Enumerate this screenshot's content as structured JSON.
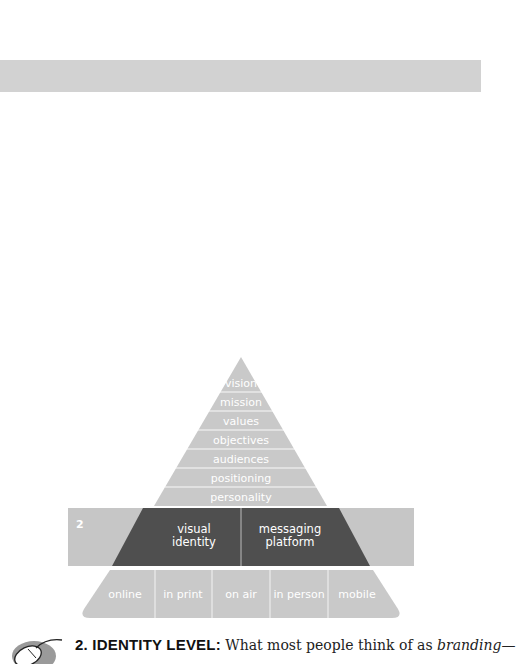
{
  "header_band": {
    "color": "#d2d2d2"
  },
  "pyramid": {
    "colors": {
      "light": "#c9c9c9",
      "band": "#c6c6c6",
      "dark": "#4f4f4f",
      "divider": "#ffffff",
      "label": "#ffffff"
    },
    "top_level": {
      "rows": [
        "vision",
        "mission",
        "values",
        "objectives",
        "audiences",
        "positioning",
        "personality"
      ]
    },
    "identity_level": {
      "number": "2",
      "cells": [
        {
          "line1": "visual",
          "line2": "identity"
        },
        {
          "line1": "messaging",
          "line2": "platform"
        }
      ]
    },
    "channel_level": {
      "cells": [
        "online",
        "in print",
        "on air",
        "in person",
        "mobile"
      ]
    }
  },
  "footer": {
    "icon": "mouse-icon",
    "heading": "2. IDENTITY LEVEL:",
    "text_before": " What most people think of as ",
    "text_italic": "branding",
    "text_after": "—"
  }
}
